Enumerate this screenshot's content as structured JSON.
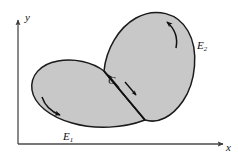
{
  "figure": {
    "kind": "math-diagram",
    "background_color": "#ffffff",
    "region_fill_color": "#c8c8c8",
    "outline_color": "#1a1a1a",
    "axis_color": "#4a4a4a"
  },
  "axes": {
    "x_label": "x",
    "y_label": "y",
    "origin": {
      "x": 18,
      "y": 144
    },
    "x_end": {
      "x": 225,
      "y": 144
    },
    "y_end": {
      "x": 18,
      "y": 18
    }
  },
  "labels": {
    "lobe_lower_left": {
      "base": "E",
      "subscript": "1"
    },
    "lobe_upper_right": {
      "base": "E",
      "subscript": "2"
    },
    "shared_curve": "C"
  },
  "annotations": [
    {
      "name": "orientation-arrow-lower-lobe",
      "direction": "clockwise-at-bottom-left"
    },
    {
      "name": "orientation-arrow-upper-lobe",
      "direction": "counterclockwise-at-top-right"
    },
    {
      "name": "curve-arrow-upper-left",
      "direction": "up-left-along-C"
    },
    {
      "name": "curve-arrow-lower-right",
      "direction": "down-right-along-C"
    }
  ]
}
